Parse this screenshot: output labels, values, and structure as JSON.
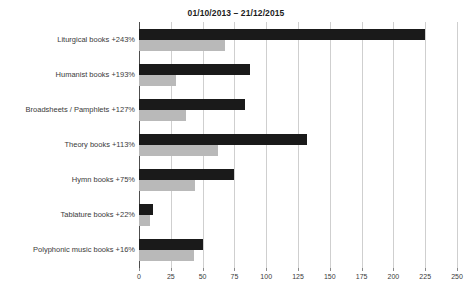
{
  "chart_data": {
    "type": "bar",
    "orientation": "horizontal",
    "title": "01/10/2013 – 21/12/2015",
    "xlabel": "",
    "ylabel": "",
    "xlim": [
      0,
      250
    ],
    "xticks": [
      0,
      25,
      50,
      75,
      100,
      125,
      150,
      175,
      200,
      225,
      250
    ],
    "grid": "vertical",
    "legend": "none",
    "categories": [
      "Liturgical books +243%",
      "Humanist books +193%",
      "Broadsheets / Pamphlets +127%",
      "Theory books +113%",
      "Hymn books +75%",
      "Tablature books +22%",
      "Polyphonic music books +16%"
    ],
    "series": [
      {
        "name": "dark",
        "color": "#1a1a1a",
        "values": [
          225,
          87,
          83,
          132,
          75,
          11,
          50
        ]
      },
      {
        "name": "light",
        "color": "#b9b9b9",
        "values": [
          68,
          29,
          37,
          62,
          44,
          9,
          43
        ]
      }
    ]
  },
  "axis": {
    "tick_labels": [
      "0",
      "25",
      "50",
      "75",
      "100",
      "125",
      "150",
      "175",
      "200",
      "225",
      "250"
    ]
  }
}
